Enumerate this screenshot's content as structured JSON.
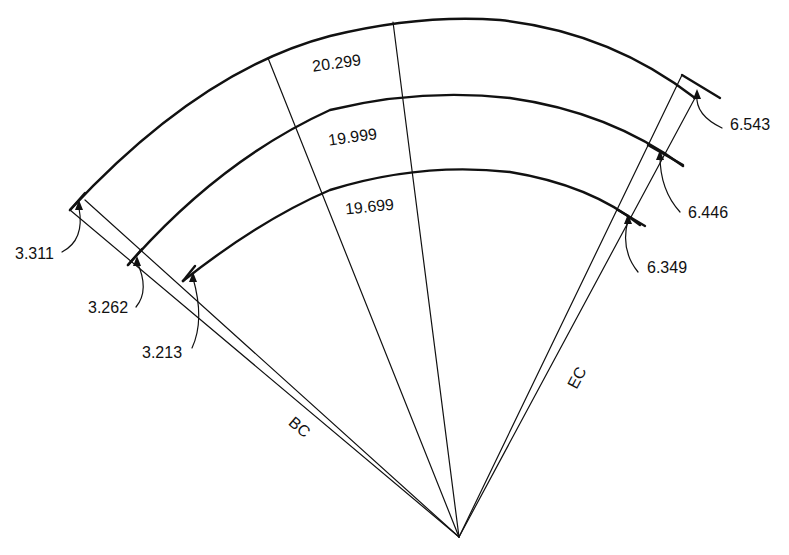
{
  "diagram": {
    "title": "",
    "colors": {
      "line": "#111111",
      "background": "#ffffff"
    },
    "arc_labels": {
      "outer": "20.299",
      "middle": "19.999",
      "inner": "19.699"
    },
    "bc_offsets": {
      "outer": "3.311",
      "middle": "3.262",
      "inner": "3.213"
    },
    "ec_offsets": {
      "outer": "6.543",
      "middle": "6.446",
      "inner": "6.349"
    },
    "line_labels": {
      "bc": "BC",
      "ec": "EC"
    }
  }
}
